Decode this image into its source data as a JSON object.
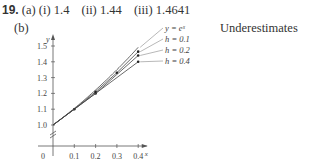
{
  "problem": {
    "number": "19.",
    "part_a_label": "(a)",
    "answers": [
      {
        "label": "(i)",
        "value": "1.4"
      },
      {
        "label": "(ii)",
        "value": "1.44"
      },
      {
        "label": "(iii)",
        "value": "1.4641"
      }
    ],
    "part_b_label": "(b)",
    "conclusion": "Underestimates"
  },
  "chart_data": {
    "type": "line",
    "title": "",
    "xlabel": "x",
    "ylabel": "y",
    "x_ticks": [
      "0",
      "0.1",
      "0.2",
      "0.3",
      "0.4"
    ],
    "y_ticks": [
      "1.0",
      "1.1",
      "1.2",
      "1.3",
      "1.4",
      "1.5"
    ],
    "xlim": [
      0,
      0.45
    ],
    "ylim": [
      1.0,
      1.55
    ],
    "y_axis_break": true,
    "grid": false,
    "legend_position": "annotations at right end of curves",
    "series": [
      {
        "name": "y = e^x",
        "x": [
          0,
          0.1,
          0.2,
          0.3,
          0.4
        ],
        "y": [
          1.0,
          1.1052,
          1.2214,
          1.3499,
          1.4918
        ]
      },
      {
        "name": "h = 0.1",
        "x": [
          0,
          0.1,
          0.2,
          0.3,
          0.4
        ],
        "y": [
          1.0,
          1.1,
          1.21,
          1.331,
          1.4641
        ]
      },
      {
        "name": "h = 0.2",
        "x": [
          0,
          0.2,
          0.4
        ],
        "y": [
          1.0,
          1.2,
          1.44
        ]
      },
      {
        "name": "h = 0.4",
        "x": [
          0,
          0.4
        ],
        "y": [
          1.0,
          1.4
        ]
      }
    ]
  }
}
